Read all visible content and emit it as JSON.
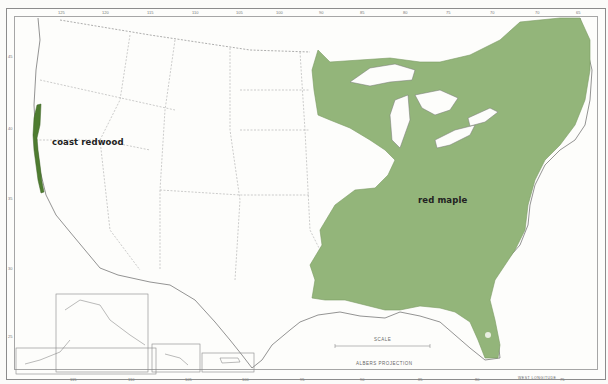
{
  "map": {
    "title": "",
    "species": [
      {
        "name": "coast redwood",
        "color": "#4e7c30"
      },
      {
        "name": "red maple",
        "color": "#93b57a"
      }
    ],
    "scale": {
      "title": "SCALE",
      "miles_ticks": [
        "0",
        "100",
        "200",
        "300",
        "400",
        "MILES"
      ],
      "km_ticks": [
        "0",
        "200",
        "400",
        "600 KILOMETERS"
      ]
    },
    "projection": "ALBERS PROJECTION",
    "top_longitudes": [
      "125",
      "120",
      "115",
      "110",
      "105",
      "100",
      "95",
      "90",
      "85",
      "80",
      "75",
      "70",
      "65"
    ],
    "bottom_longitudes": [
      "115",
      "110",
      "105",
      "100",
      "95",
      "90",
      "85",
      "80",
      "75"
    ],
    "west_longitude_label": "WEST LONGITUDE",
    "latitudes": [
      "45",
      "40",
      "35",
      "30",
      "25"
    ],
    "insets": [
      "Alaska",
      "Hawaii",
      "Puerto Rico"
    ]
  }
}
